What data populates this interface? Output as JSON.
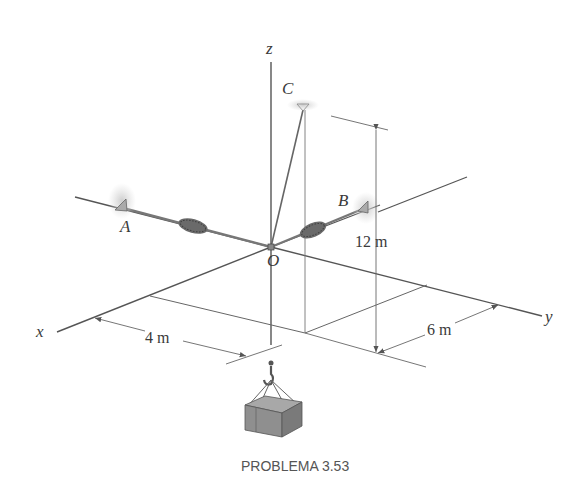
{
  "figure": {
    "caption": "PROBLEMA 3.53",
    "axes": {
      "x": "x",
      "y": "y",
      "z": "z"
    },
    "points": {
      "A": "A",
      "B": "B",
      "C": "C",
      "O": "O"
    },
    "dimensions": {
      "height": "12 m",
      "x_offset": "4 m",
      "y_offset": "6 m"
    },
    "colors": {
      "line": "#555555",
      "spring": "#5a5a5a",
      "support": "#bdbdbd",
      "crate": "#8a8a8a"
    }
  }
}
